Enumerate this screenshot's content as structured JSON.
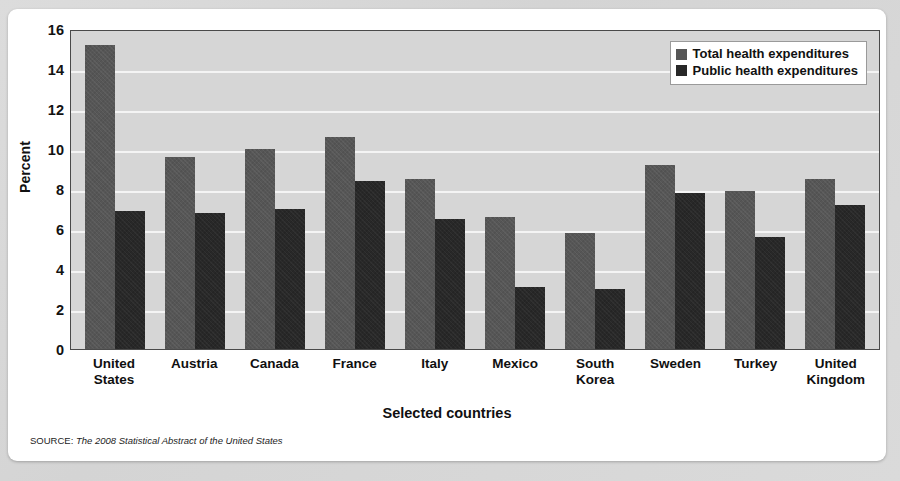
{
  "chart_data": {
    "type": "bar",
    "title": "",
    "xlabel": "Selected countries",
    "ylabel": "Percent",
    "ylim": [
      0,
      16
    ],
    "yticks": [
      16,
      14,
      12,
      10,
      8,
      6,
      4,
      2,
      0
    ],
    "grid": true,
    "legend_position": "top-right",
    "categories": [
      "United States",
      "Austria",
      "Canada",
      "France",
      "Italy",
      "Mexico",
      "South Korea",
      "Sweden",
      "Turkey",
      "United Kingdom"
    ],
    "category_lines": [
      [
        "United",
        "States"
      ],
      [
        "Austria"
      ],
      [
        "Canada"
      ],
      [
        "France"
      ],
      [
        "Italy"
      ],
      [
        "Mexico"
      ],
      [
        "South",
        "Korea"
      ],
      [
        "Sweden"
      ],
      [
        "Turkey"
      ],
      [
        "United",
        "Kingdom"
      ]
    ],
    "series": [
      {
        "name": "Total health expenditures",
        "color": "#565656",
        "values": [
          15.2,
          9.6,
          10.0,
          10.6,
          8.5,
          6.6,
          5.8,
          9.2,
          7.9,
          8.5
        ]
      },
      {
        "name": "Public health expenditures",
        "color": "#282828",
        "values": [
          6.9,
          6.8,
          7.0,
          8.4,
          6.5,
          3.1,
          3.0,
          7.8,
          5.6,
          7.2
        ]
      }
    ]
  },
  "legend": {
    "items": [
      {
        "label": "Total health expenditures",
        "swatch": "total"
      },
      {
        "label": "Public health expenditures",
        "swatch": "public"
      }
    ]
  },
  "axis": {
    "y_title": "Percent",
    "x_title": "Selected countries",
    "y_ticks": [
      "16",
      "14",
      "12",
      "10",
      "8",
      "6",
      "4",
      "2",
      "0"
    ]
  },
  "source": {
    "prefix": "SOURCE:",
    "title": "The 2008 Statistical Abstract of the United States"
  },
  "colors": {
    "plot_background": "#d6d6d6",
    "gridline": "#f4f4f4",
    "total_bar": "#565656",
    "public_bar": "#282828",
    "card_background": "#ffffff",
    "page_background": "#d9d9d9"
  }
}
